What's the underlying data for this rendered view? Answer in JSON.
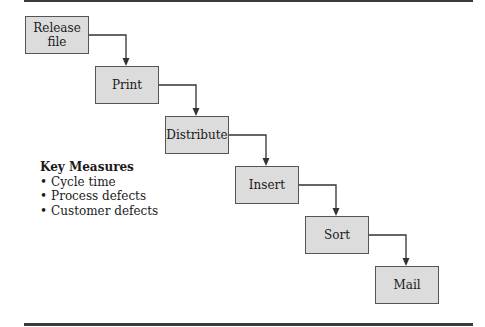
{
  "diagram": {
    "type": "process-flow-staircase",
    "steps": [
      {
        "label": "Release\nfile"
      },
      {
        "label": "Print"
      },
      {
        "label": "Distribute"
      },
      {
        "label": "Insert"
      },
      {
        "label": "Sort"
      },
      {
        "label": "Mail"
      }
    ],
    "key_measures": {
      "title": "Key Measures",
      "items": [
        "Cycle time",
        "Process defects",
        "Customer defects"
      ]
    },
    "colors": {
      "box_fill": "#dcdcdc",
      "box_border": "#555555",
      "arrow": "#333333",
      "rule": "#3a3a3a"
    }
  }
}
